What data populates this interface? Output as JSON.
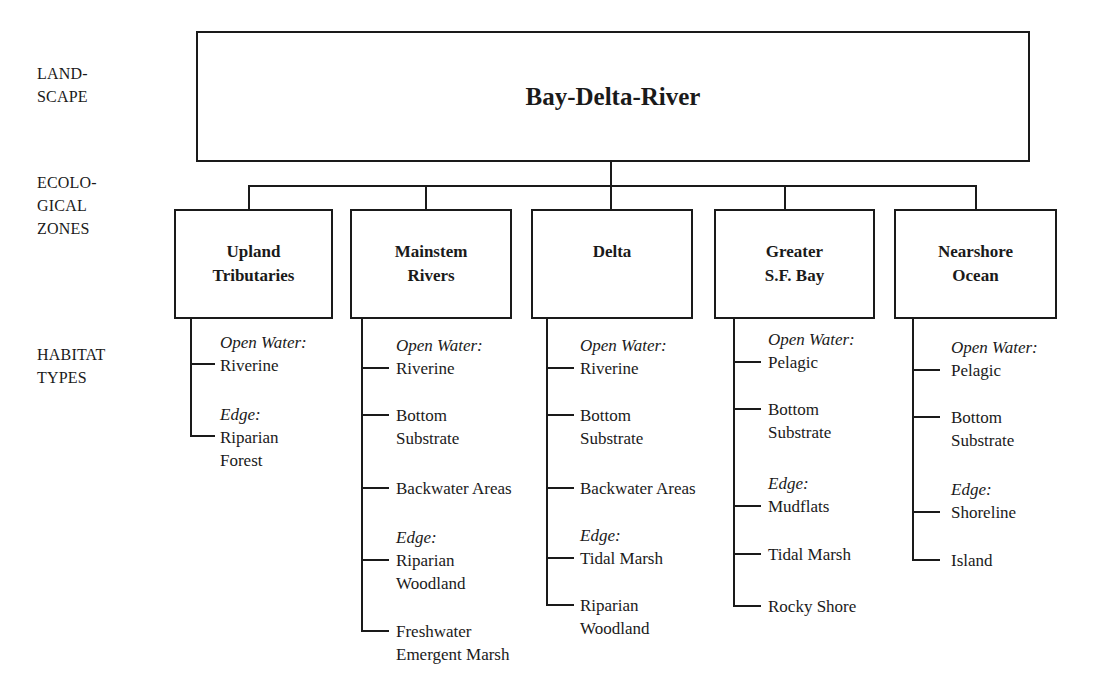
{
  "row_labels": {
    "landscape": [
      "LAND-",
      "SCAPE"
    ],
    "ecological_zones": [
      "ECOLO-",
      "GICAL",
      "ZONES"
    ],
    "habitat_types": [
      "HABITAT",
      "TYPES"
    ]
  },
  "landscape": {
    "title": "Bay-Delta-River"
  },
  "zones": [
    {
      "title": [
        "Upland",
        "Tributaries"
      ],
      "habitats": [
        {
          "category": "Open Water:",
          "name": [
            "Riverine"
          ]
        },
        {
          "category": "Edge:",
          "name": [
            "Riparian",
            "Forest"
          ]
        }
      ]
    },
    {
      "title": [
        "Mainstem",
        "Rivers"
      ],
      "habitats": [
        {
          "category": "Open Water:",
          "name": [
            "Riverine"
          ]
        },
        {
          "category": "",
          "name": [
            "Bottom",
            "Substrate"
          ]
        },
        {
          "category": "",
          "name": [
            "Backwater Areas"
          ]
        },
        {
          "category": "Edge:",
          "name": [
            "Riparian",
            "Woodland"
          ]
        },
        {
          "category": "",
          "name": [
            "Freshwater",
            "Emergent Marsh"
          ]
        }
      ]
    },
    {
      "title": [
        "Delta"
      ],
      "habitats": [
        {
          "category": "Open Water:",
          "name": [
            "Riverine"
          ]
        },
        {
          "category": "",
          "name": [
            "Bottom",
            "Substrate"
          ]
        },
        {
          "category": "",
          "name": [
            "Backwater Areas"
          ]
        },
        {
          "category": "Edge:",
          "name": [
            "Tidal Marsh"
          ]
        },
        {
          "category": "",
          "name": [
            "Riparian",
            "Woodland"
          ]
        }
      ]
    },
    {
      "title": [
        "Greater",
        "S.F. Bay"
      ],
      "habitats": [
        {
          "category": "Open Water:",
          "name": [
            "Pelagic"
          ]
        },
        {
          "category": "",
          "name": [
            "Bottom",
            "Substrate"
          ]
        },
        {
          "category": "Edge:",
          "name": [
            "Mudflats"
          ]
        },
        {
          "category": "",
          "name": [
            "Tidal Marsh"
          ]
        },
        {
          "category": "",
          "name": [
            "Rocky Shore"
          ]
        }
      ]
    },
    {
      "title": [
        "Nearshore",
        "Ocean"
      ],
      "habitats": [
        {
          "category": "Open Water:",
          "name": [
            "Pelagic"
          ]
        },
        {
          "category": "",
          "name": [
            "Bottom",
            "Substrate"
          ]
        },
        {
          "category": "Edge:",
          "name": [
            "Shoreline"
          ]
        },
        {
          "category": "",
          "name": [
            "Island"
          ]
        }
      ]
    }
  ],
  "colors": {
    "line": "#1a1a1a",
    "background": "#ffffff"
  }
}
